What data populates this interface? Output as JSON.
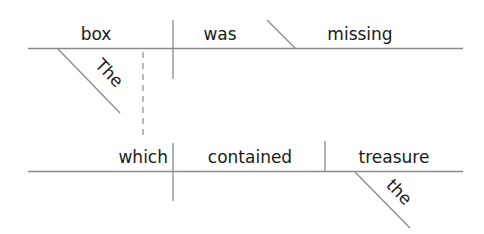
{
  "diagram": {
    "type": "Reed-Kellogg sentence diagram",
    "main_clause": {
      "subject": "box",
      "verb": "was",
      "complement": "missing",
      "subject_modifier": "The"
    },
    "relative_clause": {
      "subject": "which",
      "verb": "contained",
      "object": "treasure",
      "object_modifier": "the"
    },
    "colors": {
      "lines": "#8a8a8a",
      "text": "#1a1a1a"
    }
  }
}
